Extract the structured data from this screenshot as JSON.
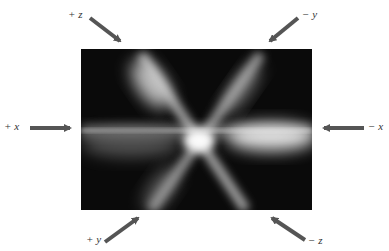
{
  "figure": {
    "photo": {
      "background": "#0b0b0b",
      "beam_color": "#e8e8e8"
    },
    "arrow_color": "#555555",
    "labels": {
      "plus_z": "+ z",
      "minus_y": "− y",
      "plus_x": "+ x",
      "minus_x": "− x",
      "plus_y": "+ y",
      "minus_z": "− z"
    }
  }
}
